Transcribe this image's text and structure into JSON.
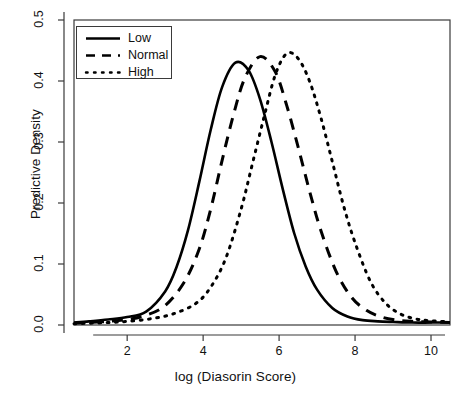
{
  "chart_data": {
    "type": "line",
    "title": "",
    "xlabel": "log (Diasorin Score)",
    "ylabel": "Predictive Density",
    "xlim": [
      0.6,
      10.5
    ],
    "ylim": [
      0.0,
      0.5
    ],
    "xticks": [
      2,
      4,
      6,
      8,
      10
    ],
    "xtick_labels": [
      "2",
      "4",
      "6",
      "8",
      "10"
    ],
    "yticks": [
      0.0,
      0.1,
      0.2,
      0.3,
      0.4,
      0.5
    ],
    "ytick_labels": [
      "0.0",
      "0.1",
      "0.2",
      "0.3",
      "0.4",
      "0.5"
    ],
    "grid": false,
    "legend_position": "top-left",
    "legend_entries": [
      {
        "label": "Low",
        "style": "solid"
      },
      {
        "label": "Normal",
        "style": "dashed"
      },
      {
        "label": "High",
        "style": "dotted"
      }
    ],
    "series": [
      {
        "name": "Low",
        "style": "solid",
        "color": "#000000",
        "peak_x": 4.85,
        "peak_y": 0.43,
        "x": [
          0.6,
          1.0,
          1.5,
          2.0,
          2.5,
          3.0,
          3.3,
          3.6,
          3.9,
          4.2,
          4.5,
          4.85,
          5.2,
          5.5,
          5.8,
          6.1,
          6.4,
          6.7,
          7.0,
          7.4,
          7.8,
          8.2,
          8.6,
          9.0,
          9.5,
          10.0,
          10.5
        ],
        "y": [
          0.004,
          0.006,
          0.009,
          0.013,
          0.022,
          0.055,
          0.095,
          0.155,
          0.235,
          0.32,
          0.39,
          0.43,
          0.417,
          0.37,
          0.3,
          0.222,
          0.15,
          0.096,
          0.058,
          0.028,
          0.014,
          0.008,
          0.006,
          0.005,
          0.004,
          0.004,
          0.004
        ]
      },
      {
        "name": "Normal",
        "style": "dashed",
        "color": "#000000",
        "peak_x": 5.5,
        "peak_y": 0.44,
        "x": [
          0.6,
          1.0,
          1.5,
          2.0,
          2.5,
          3.0,
          3.5,
          3.9,
          4.2,
          4.5,
          4.8,
          5.1,
          5.5,
          5.9,
          6.2,
          6.5,
          6.8,
          7.1,
          7.5,
          7.9,
          8.3,
          8.7,
          9.1,
          9.5,
          10.0,
          10.5
        ],
        "y": [
          0.003,
          0.004,
          0.006,
          0.009,
          0.016,
          0.032,
          0.07,
          0.125,
          0.19,
          0.27,
          0.345,
          0.405,
          0.44,
          0.415,
          0.36,
          0.292,
          0.22,
          0.155,
          0.088,
          0.046,
          0.024,
          0.013,
          0.008,
          0.006,
          0.005,
          0.004
        ]
      },
      {
        "name": "High",
        "style": "dotted",
        "color": "#000000",
        "peak_x": 6.2,
        "peak_y": 0.445,
        "x": [
          0.6,
          1.0,
          1.5,
          2.0,
          2.6,
          3.2,
          3.8,
          4.2,
          4.6,
          5.0,
          5.3,
          5.6,
          5.9,
          6.2,
          6.5,
          6.8,
          7.1,
          7.4,
          7.7,
          8.0,
          8.4,
          8.8,
          9.2,
          9.6,
          10.0,
          10.5
        ],
        "y": [
          0.002,
          0.003,
          0.004,
          0.006,
          0.01,
          0.018,
          0.035,
          0.062,
          0.11,
          0.19,
          0.265,
          0.34,
          0.41,
          0.445,
          0.437,
          0.4,
          0.34,
          0.268,
          0.195,
          0.135,
          0.072,
          0.036,
          0.018,
          0.01,
          0.007,
          0.005
        ]
      }
    ]
  },
  "axes": {
    "x_title": "log (Diasorin Score)",
    "y_title": "Predictive Density"
  }
}
